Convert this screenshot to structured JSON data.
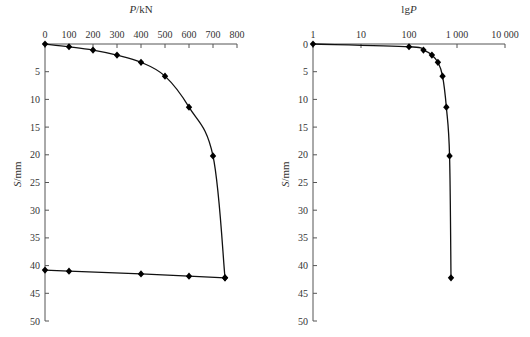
{
  "chart_data": [
    {
      "type": "line",
      "title": "",
      "xlabel": "P/kN",
      "ylabel": "S/mm",
      "x_axis_position": "top",
      "y_axis_inverted": true,
      "xlim": [
        0,
        800
      ],
      "ylim": [
        0,
        50
      ],
      "xticks": [
        0,
        100,
        200,
        300,
        400,
        500,
        600,
        700,
        800
      ],
      "yticks": [
        5,
        10,
        15,
        20,
        25,
        30,
        35,
        40,
        45,
        50
      ],
      "grid": false,
      "legend": null,
      "series": [
        {
          "name": "loading",
          "x": [
            0,
            100,
            200,
            300,
            400,
            500,
            600,
            700,
            750
          ],
          "y": [
            0,
            0.5,
            1.1,
            2.0,
            3.3,
            5.8,
            11.4,
            20.2,
            42.2
          ],
          "smooth": true
        },
        {
          "name": "unloading",
          "x": [
            750,
            600,
            400,
            100,
            0
          ],
          "y": [
            42.2,
            41.9,
            41.5,
            41.0,
            40.8
          ],
          "smooth": false
        }
      ]
    },
    {
      "type": "line",
      "title": "",
      "xlabel": "lgP",
      "ylabel": "S/mm",
      "x_axis_position": "top",
      "x_scale": "log",
      "y_axis_inverted": true,
      "xlim": [
        1,
        10000
      ],
      "ylim": [
        0,
        50
      ],
      "xticks": [
        1,
        10,
        100,
        1000,
        10000
      ],
      "xtick_labels": [
        "1",
        "10",
        "100",
        "1 000",
        "10 000"
      ],
      "yticks": [
        0,
        5,
        10,
        15,
        20,
        25,
        30,
        35,
        40,
        45,
        50
      ],
      "grid": false,
      "legend": null,
      "series": [
        {
          "name": "loading",
          "x": [
            1,
            100,
            200,
            300,
            400,
            500,
            600,
            700,
            750
          ],
          "y": [
            0,
            0.5,
            1.1,
            2.0,
            3.3,
            5.8,
            11.4,
            20.2,
            42.2
          ],
          "smooth": true
        }
      ]
    }
  ],
  "charts": {
    "left": {
      "xlabel_italic": "P",
      "xlabel_rest": "/kN",
      "ylabel_italic": "S",
      "ylabel_rest": "/mm",
      "show_y_zero_label": false
    },
    "right": {
      "xlabel_prefix": "lg",
      "xlabel_italic": "P",
      "ylabel_italic": "S",
      "ylabel_rest": "/mm",
      "show_y_zero_label": true
    }
  },
  "style": {
    "axis_color": "#555555",
    "curve_color": "#111111",
    "marker_color": "#000000"
  }
}
